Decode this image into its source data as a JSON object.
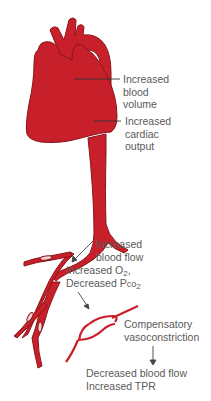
{
  "colors": {
    "blood": "#c8202a",
    "outline": "#8a1419",
    "text": "#5a5a5a",
    "leader": "#333333",
    "background": "#ffffff"
  },
  "labels": {
    "blood_volume": {
      "line1": "Increased",
      "line2": "blood",
      "line3": "volume"
    },
    "cardiac_output": {
      "line1": "Increased",
      "line2": "cardiac",
      "line3": "output"
    },
    "blood_flow": {
      "line1": "Increased",
      "line2": "blood flow"
    },
    "gases": {
      "o2_prefix": "Increased O",
      "o2_sub": "2",
      "o2_suffix": ",",
      "pco2_prefix": "Decreased P",
      "pco2_co": "co",
      "pco2_sub": "2"
    },
    "vasoconstriction": {
      "line1": "Compensatory",
      "line2": "vasoconstriction"
    },
    "result": {
      "line1": "Decreased blood flow",
      "line2": "Increased TPR"
    }
  }
}
